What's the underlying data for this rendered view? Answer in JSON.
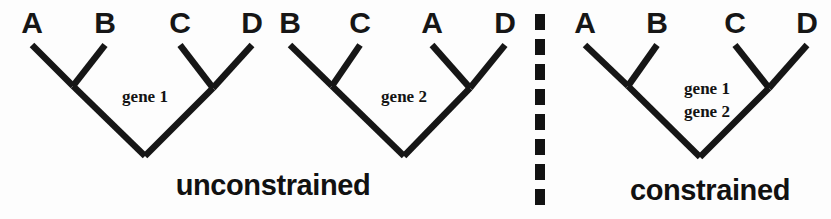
{
  "figure": {
    "background_color": "#fdfdfd",
    "ink_color": "#161616"
  },
  "trees": [
    {
      "id": "tree-unconstrained-gene1",
      "tips": [
        "A",
        "B",
        "C",
        "D"
      ],
      "gene_labels": [
        "gene 1"
      ],
      "topology": "((A,B),(C,D))"
    },
    {
      "id": "tree-unconstrained-gene2",
      "tips": [
        "B",
        "C",
        "A",
        "D"
      ],
      "gene_labels": [
        "gene 2"
      ],
      "topology": "((B,C),(A,D))"
    },
    {
      "id": "tree-constrained",
      "tips": [
        "A",
        "B",
        "C",
        "D"
      ],
      "gene_labels": [
        "gene 1",
        "gene 2"
      ],
      "topology": "((A,B),(C,D))"
    }
  ],
  "captions": {
    "left": "unconstrained",
    "right": "constrained"
  },
  "divider": {
    "style": "dashed-vertical",
    "dash_count": 8,
    "color": "#121212"
  }
}
